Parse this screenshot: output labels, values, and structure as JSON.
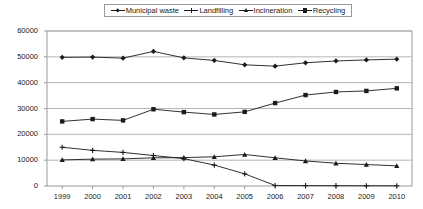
{
  "chart_data": {
    "type": "line",
    "title": "",
    "xlabel": "",
    "ylabel": "",
    "x": [
      1999,
      2000,
      2001,
      2002,
      2003,
      2004,
      2005,
      2006,
      2007,
      2008,
      2009,
      2010
    ],
    "xtick_labels": [
      "1999",
      "2000",
      "2001",
      "2002",
      "2003",
      "2004",
      "2005",
      "2006",
      "2007",
      "2008",
      "2009",
      "2010"
    ],
    "ylim": [
      0,
      60000
    ],
    "ytick_labels": [
      "0",
      "10000",
      "20000",
      "30000",
      "40000",
      "50000",
      "60000"
    ],
    "yticks": [
      0,
      10000,
      20000,
      30000,
      40000,
      50000,
      60000
    ],
    "grid": true,
    "legend_position": "top",
    "series": [
      {
        "name": "Municipal waste",
        "marker": "diamond",
        "color": "#1a1a1a",
        "values": [
          49800,
          49900,
          49500,
          52100,
          49600,
          48600,
          46900,
          46400,
          47700,
          48400,
          48800,
          49100
        ]
      },
      {
        "name": "Landfilling",
        "marker": "plus",
        "color": "#1a1a1a",
        "values": [
          15000,
          13800,
          13000,
          11800,
          10600,
          8100,
          4700,
          200,
          150,
          120,
          100,
          90
        ]
      },
      {
        "name": "Incineration",
        "marker": "triangle",
        "color": "#1a1a1a",
        "values": [
          10100,
          10400,
          10500,
          10900,
          11000,
          11300,
          12200,
          10900,
          9700,
          8800,
          8300,
          7800
        ]
      },
      {
        "name": "Recycling",
        "marker": "square",
        "color": "#1a1a1a",
        "values": [
          25000,
          25900,
          25400,
          29700,
          28600,
          27700,
          28700,
          32100,
          35200,
          36400,
          36800,
          37800
        ]
      }
    ]
  },
  "axes": {
    "frame_color": "#9a9a9a",
    "grid_color": "#b5b5b5",
    "text_color": "#1a1a1a"
  }
}
